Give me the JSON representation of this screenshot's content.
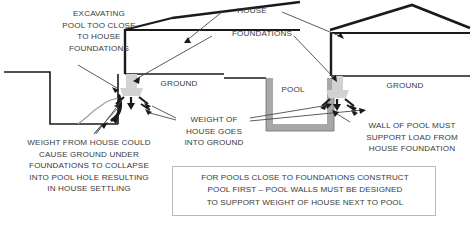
{
  "diagram": {
    "title_labels": {
      "house": "HOUSE",
      "foundations": "FOUNDATIONS",
      "ground_left": "GROUND",
      "ground_right": "GROUND",
      "pool": "POOL"
    },
    "annotations": {
      "excavating": "EXCAVATING\nPOOL TOO CLOSE\nTO HOUSE\nFOUNDATIONS",
      "weight_from_house": "WEIGHT FROM HOUSE COULD\nCAUSE GROUND UNDER\nFOUNDATIONS TO COLLAPSE\nINTO POOL HOLE RESULTING\nIN HOUSE SETTLING",
      "weight_of_house": "WEIGHT OF\nHOUSE GOES\nINTO GROUND",
      "wall_of_pool": "WALL OF POOL MUST\nSUPPORT LOAD FROM\nHOUSE FOUNDATION"
    },
    "caption": "FOR POOLS CLOSE TO FOUNDATIONS CONSTRUCT\nPOOL FIRST – POOL WALLS MUST BE DESIGNED\nTO SUPPORT WEIGHT OF HOUSE NEXT TO POOL",
    "colors": {
      "line": "#1a1a1a",
      "text": "#3a3a3a",
      "footing_fill": "#d2d2d2",
      "pool_wall": "#a8a8a8",
      "leader": "#4a4a4a",
      "caption_border": "#b9b9b9",
      "background": "#ffffff"
    }
  }
}
